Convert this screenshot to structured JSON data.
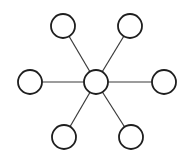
{
  "diagram": {
    "type": "star-network",
    "hub": {
      "id": "hub",
      "label": ""
    },
    "leaves": [
      {
        "id": "top-left",
        "label": ""
      },
      {
        "id": "top-right",
        "label": ""
      },
      {
        "id": "left",
        "label": ""
      },
      {
        "id": "right",
        "label": ""
      },
      {
        "id": "bottom-left",
        "label": ""
      },
      {
        "id": "bottom-right",
        "label": ""
      }
    ],
    "edges": [
      [
        "hub",
        "top-left"
      ],
      [
        "hub",
        "top-right"
      ],
      [
        "hub",
        "left"
      ],
      [
        "hub",
        "right"
      ],
      [
        "hub",
        "bottom-left"
      ],
      [
        "hub",
        "bottom-right"
      ]
    ],
    "colors": {
      "stroke": "#1e1e1e",
      "fill": "#ffffff",
      "edge": "#3a3a3a"
    }
  }
}
